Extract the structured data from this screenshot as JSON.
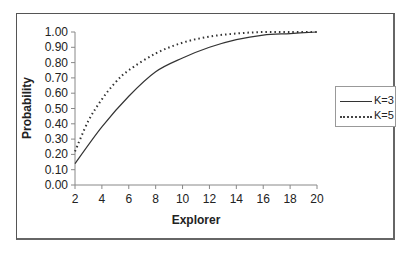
{
  "chart_data": {
    "type": "line",
    "title": "",
    "xlabel": "Explorer",
    "ylabel": "Probability",
    "xlim": [
      2,
      20
    ],
    "ylim": [
      0,
      1
    ],
    "x_ticks": [
      "2",
      "4",
      "6",
      "8",
      "10",
      "12",
      "14",
      "16",
      "18",
      "20"
    ],
    "y_ticks": [
      "0.00",
      "0.10",
      "0.20",
      "0.30",
      "0.40",
      "0.50",
      "0.60",
      "0.70",
      "0.80",
      "0.90",
      "1.00"
    ],
    "grid": false,
    "legend_position": "right",
    "series": [
      {
        "name": "K=3",
        "style": "solid",
        "x": [
          2,
          4,
          6,
          8,
          10,
          12,
          14,
          16,
          18,
          20
        ],
        "values": [
          0.14,
          0.38,
          0.58,
          0.74,
          0.83,
          0.9,
          0.95,
          0.98,
          0.99,
          1.0
        ]
      },
      {
        "name": "K=5",
        "style": "dotted",
        "x": [
          2,
          3,
          4,
          5,
          6,
          8,
          10,
          12,
          14,
          16,
          18,
          20
        ],
        "values": [
          0.22,
          0.42,
          0.56,
          0.67,
          0.75,
          0.86,
          0.93,
          0.97,
          0.99,
          1.0,
          1.0,
          1.0
        ]
      }
    ]
  },
  "colors": {
    "line": "#333333",
    "axis": "#888888",
    "frame": "#555555"
  }
}
